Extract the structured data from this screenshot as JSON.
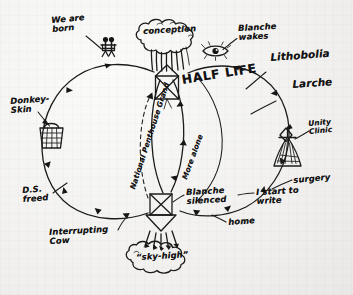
{
  "meta": {
    "kind": "hand-drawn-diagram",
    "medium": "black ink pen on faintly ruled off-white paper",
    "ink_color": "#161616",
    "paper_color": "#f2f2f0"
  },
  "nodes": {
    "conception": "conception",
    "half_life": "HALF LIFE",
    "blanche_silenced": "Blanche\nsilenced",
    "sky_high": "“sky-high”"
  },
  "labels": {
    "we_are_born": "We are\nborn",
    "blanche_wakes": "Blanche\nwakes",
    "lithobolia": "Lithobolia",
    "larche": "Larche",
    "unity_clinic": "Unity\nClinic",
    "surgery": "surgery",
    "i_start_to_write": "I start to\nwrite",
    "home": "home",
    "interrupting_cow": "Interrupting\nCow",
    "ds_freed": "D.S.\nfreed",
    "donkey_skin": "Donkey-\nSkin"
  },
  "edge_labels": {
    "national_penthouse_grand": "National Penthouse Grand",
    "more_alone": "More alone"
  },
  "icons": [
    {
      "name": "two-figures-icon",
      "meaning": "two stick figures (a pair of people)"
    },
    {
      "name": "tree-cloud-icon",
      "meaning": "cloud-shaped tree canopy holding the word conception"
    },
    {
      "name": "eye-icon",
      "meaning": "open eye with lashes"
    },
    {
      "name": "house-box-x-icon",
      "meaning": "house with an X drawn through a square"
    },
    {
      "name": "basket-grid-icon",
      "meaning": "small hatched basket"
    },
    {
      "name": "clinic-tent-icon",
      "meaning": "hatched tent / clinic building"
    },
    {
      "name": "box-x-funnel-icon",
      "meaning": "square with X above a downward funnel"
    },
    {
      "name": "cloud-icon",
      "meaning": "cloud containing sky-high"
    }
  ],
  "structure": {
    "type": "cycle diagram",
    "loops": [
      "left outer loop",
      "right outer loop",
      "inner narrow loop"
    ],
    "junctions": [
      "HALF LIFE box (top)",
      "Blanche silenced box (bottom)"
    ]
  }
}
